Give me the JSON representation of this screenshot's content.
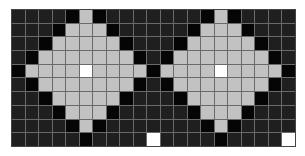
{
  "pattern": {
    "columns": 21,
    "rows": 10,
    "legend": {
      "D": {
        "meaning": "dark background cell",
        "color": "#1f1f1f"
      },
      "B": {
        "meaning": "black outline cell",
        "color": "#050505"
      },
      "G": {
        "meaning": "light gray diamond cell",
        "color": "#c2c2c2"
      },
      "W": {
        "meaning": "white cell",
        "color": "#ffffff"
      }
    },
    "grid": [
      "DDDDBGBDDDDDDDBGBDDDD",
      "DDDBGGGBDDDDDDBGGGBDDD",
      "DDBGGGGGBDDDDBGGGGGBDD",
      "DBGGGGGGGBDDBGGGGGGGBD",
      "BGGGGWGGGGBGGGGWGGGGB",
      "DBGGGGGGGBDDBGGGGGGGBD",
      "DDBGGGGGBDDDDBGGGGGBDD",
      "DDDBGGGBDDDDDDBGGGBDDD",
      "DDDDBGBDDDDDDDDBGBDDDD",
      "DDDDDBDDDDWDDDDDBDDDDW"
    ]
  }
}
